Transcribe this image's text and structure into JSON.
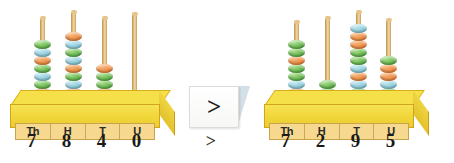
{
  "scene": {
    "background_color": "#ffffff",
    "title": "Place value abacus comparison"
  },
  "abacuses": [
    {
      "id": "left",
      "position": "left",
      "number": "7840",
      "column_labels": [
        "Th",
        "H",
        "T",
        "U"
      ],
      "digits": [
        "7",
        "8",
        "4",
        "0"
      ],
      "rods": [
        {
          "label": "Th",
          "bead_count": 7,
          "bead_colors": [
            "orange",
            "green",
            "blue",
            "green",
            "orange",
            "blue",
            "green"
          ]
        },
        {
          "label": "H",
          "bead_count": 8,
          "bead_colors": [
            "orange",
            "blue",
            "green",
            "orange",
            "blue",
            "green",
            "blue",
            "green"
          ]
        },
        {
          "label": "T",
          "bead_count": 4,
          "bead_colors": [
            "orange",
            "green",
            "green",
            "orange"
          ]
        },
        {
          "label": "U",
          "bead_count": 0,
          "bead_colors": []
        }
      ],
      "base_color": "#f2d83d",
      "label_strip_color": "#f6d98e"
    },
    {
      "id": "right",
      "position": "right",
      "number": "7295",
      "column_labels": [
        "Th",
        "H",
        "T",
        "U"
      ],
      "digits": [
        "7",
        "2",
        "9",
        "5"
      ],
      "rods": [
        {
          "label": "Th",
          "bead_count": 7,
          "bead_colors": [
            "green",
            "green",
            "orange",
            "green",
            "green",
            "blue",
            "orange"
          ]
        },
        {
          "label": "H",
          "bead_count": 2,
          "bead_colors": [
            "green",
            "green"
          ]
        },
        {
          "label": "T",
          "bead_count": 9,
          "bead_colors": [
            "blue",
            "orange",
            "orange",
            "green",
            "green",
            "blue",
            "orange",
            "blue",
            "green"
          ]
        },
        {
          "label": "U",
          "bead_count": 5,
          "bead_colors": [
            "green",
            "orange",
            "orange",
            "blue",
            "green"
          ]
        }
      ],
      "base_color": "#f2d83d",
      "label_strip_color": "#f6d98e"
    }
  ],
  "comparison": {
    "card_symbol": ">",
    "written_symbol": ">",
    "card_color": "#ffffff"
  },
  "bead_palette": {
    "green": "#66b94f",
    "orange": "#ef8d45",
    "blue": "#8ecddd"
  }
}
